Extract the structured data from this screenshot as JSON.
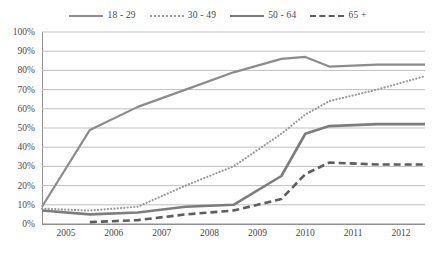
{
  "chart_data": {
    "type": "line",
    "title": "",
    "subtitle": "",
    "xlabel": "",
    "ylabel": "",
    "xlim": [
      2005,
      2013
    ],
    "ylim": [
      0,
      100
    ],
    "ytick_labels": [
      "100%",
      "90%",
      "80%",
      "70%",
      "60%",
      "50%",
      "40%",
      "30%",
      "20%",
      "10%",
      "0%"
    ],
    "ytick_values": [
      100,
      90,
      80,
      70,
      60,
      50,
      40,
      30,
      20,
      10,
      0
    ],
    "xtick_labels": [
      "2005",
      "2006",
      "2007",
      "2008",
      "2009",
      "2010",
      "2011",
      "2012"
    ],
    "xtick_values": [
      2005,
      2006,
      2007,
      2008,
      2009,
      2010,
      2011,
      2012
    ],
    "grid": "horizontal",
    "legend_position": "top-center",
    "line_color": "#8c8c8c",
    "grid_color": "#bfbfbf",
    "axis_color": "#8f8f8f",
    "x": [
      2005,
      2006,
      2007,
      2008,
      2009,
      2010,
      2010.5,
      2011,
      2012,
      2013
    ],
    "series": [
      {
        "name": "18 - 29",
        "style": "solid",
        "color": "#8c8c8c",
        "width": 2.2,
        "values": [
          9,
          49,
          61,
          70,
          79,
          86,
          87,
          82,
          83,
          83
        ]
      },
      {
        "name": "30 - 49",
        "style": "dotted",
        "color": "#9a9a9a",
        "width": 2.2,
        "values": [
          8,
          7,
          9,
          20,
          30,
          47,
          57,
          64,
          70,
          77
        ]
      },
      {
        "name": "50 - 64",
        "style": "solid",
        "color": "#7d7d7d",
        "width": 2.6,
        "values": [
          7,
          5,
          6,
          9,
          10,
          25,
          47,
          51,
          52,
          52
        ]
      },
      {
        "name": "65 +",
        "style": "dashed",
        "color": "#5e5e5e",
        "width": 2.6,
        "values": [
          null,
          1,
          2,
          5,
          7,
          13,
          26,
          32,
          31,
          31
        ]
      }
    ]
  }
}
